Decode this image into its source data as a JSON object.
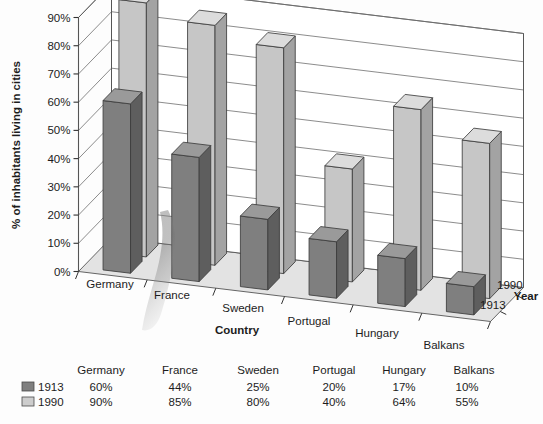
{
  "chart_data": {
    "type": "bar",
    "title": "",
    "xlabel": "Country",
    "ylabel": "% of inhabitants living in cities",
    "zlabel": "Year",
    "categories": [
      "Germany",
      "France",
      "Sweden",
      "Portugal",
      "Hungary",
      "Balkans"
    ],
    "series": [
      {
        "name": "1913",
        "values": [
          60,
          44,
          25,
          20,
          17,
          10
        ],
        "color": "#7f7f7f"
      },
      {
        "name": "1990",
        "values": [
          90,
          85,
          80,
          40,
          64,
          55
        ],
        "color": "#c6c6c6"
      }
    ],
    "ylim": [
      0,
      90
    ],
    "yticks": [
      0,
      10,
      20,
      30,
      40,
      50,
      60,
      70,
      80,
      90
    ],
    "ytick_labels": [
      "0%",
      "10%",
      "20%",
      "30%",
      "40%",
      "50%",
      "60%",
      "70%",
      "80%",
      "90%"
    ],
    "grid": true,
    "legend_position": "bottom-table",
    "projection": "3d-columns"
  },
  "axes": {
    "y_label": "% of inhabitants living in cities",
    "y_ticks": [
      "90%",
      "80%",
      "70%",
      "60%",
      "50%",
      "40%",
      "30%",
      "20%",
      "10%",
      "0%"
    ],
    "x_label": "Country",
    "x_categories": [
      "Germany",
      "France",
      "Sweden",
      "Portugal",
      "Hungary",
      "Balkans"
    ],
    "z_label": "Year",
    "z_categories": [
      "1990",
      "1913"
    ]
  },
  "table": {
    "column_headers": [
      "Germany",
      "France",
      "Sweden",
      "Portugal",
      "Hungary",
      "Balkans"
    ],
    "rows": [
      {
        "series": "1913",
        "swatch_color": "#7f7f7f",
        "values": [
          "60%",
          "44%",
          "25%",
          "20%",
          "17%",
          "10%"
        ]
      },
      {
        "series": "1990",
        "swatch_color": "#cdcdcd",
        "values": [
          "90%",
          "85%",
          "80%",
          "40%",
          "64%",
          "55%"
        ]
      }
    ]
  },
  "colors": {
    "bar_1913_front": "#7f7f7f",
    "bar_1913_top": "#9a9a9a",
    "bar_1913_side": "#5e5e5e",
    "bar_1990_front": "#c6c6c6",
    "bar_1990_top": "#dcdcdc",
    "bar_1990_side": "#a3a3a3",
    "floor": "#e3e3e3",
    "wall": "#ffffff",
    "outline": "#555555",
    "text": "#1c1c1c"
  }
}
